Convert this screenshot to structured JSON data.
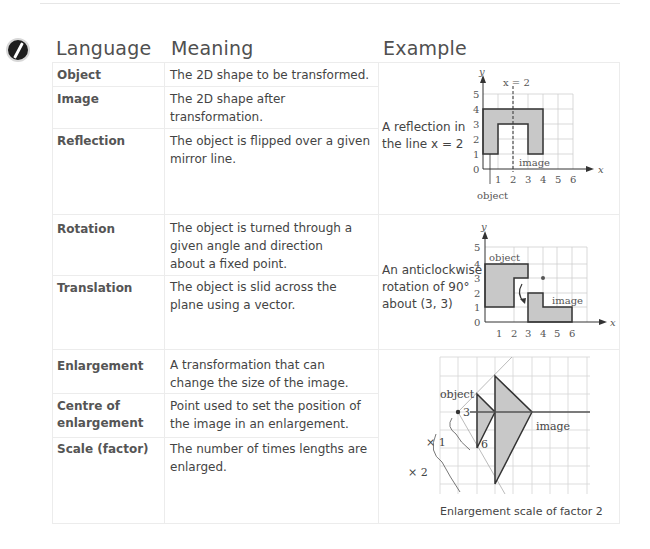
{
  "header": {
    "language": "Language",
    "meaning": "Meaning",
    "example": "Example"
  },
  "rows": [
    {
      "term": "Object",
      "meaning": "The 2D shape to be transformed."
    },
    {
      "term": "Image",
      "meaning": "The 2D shape after transformation."
    },
    {
      "term": "Reflection",
      "meaning": "The object is flipped over a given mirror line."
    },
    {
      "term": "Rotation",
      "meaning": "The object is turned through a given angle and direction about a fixed point."
    },
    {
      "term": "Translation",
      "meaning": "The object is slid across the plane using a vector."
    },
    {
      "term": "Enlargement",
      "meaning": "A transformation that can change the size of the image."
    },
    {
      "term_line1": "Centre of",
      "term_line2": "enlargement",
      "meaning": "Point used to set the position of the image in an enlargement."
    },
    {
      "term": "Scale (factor)",
      "meaning": "The number of times lengths are enlarged."
    }
  ],
  "examples": {
    "reflection": {
      "text_line1": "A reflection in",
      "text_line2": "the line x = 2",
      "mirror_label": "x = 2",
      "axis_x": "x",
      "axis_y": "y",
      "x_ticks": [
        "1",
        "2",
        "3",
        "4",
        "5",
        "6"
      ],
      "y_ticks": [
        "0",
        "1",
        "2",
        "3",
        "4",
        "5"
      ],
      "object_label": "object",
      "image_label": "image"
    },
    "rotation": {
      "text_line1": "An anticlockwise",
      "text_line2": "rotation of 90°",
      "text_line3": "about (3, 3)",
      "axis_x": "x",
      "axis_y": "y",
      "x_ticks": [
        "1",
        "2",
        "3",
        "4",
        "5",
        "6"
      ],
      "y_ticks": [
        "0",
        "1",
        "2",
        "3",
        "4",
        "5"
      ],
      "object_label": "object",
      "image_label": "image"
    },
    "enlargement": {
      "object_label": "object",
      "image_label": "image",
      "len_3": "3",
      "len_6": "6",
      "times1": "× 1",
      "times2": "× 2",
      "caption": "Enlargement scale of factor 2"
    }
  }
}
